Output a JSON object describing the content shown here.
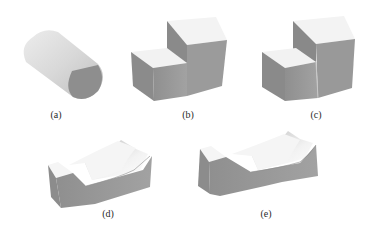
{
  "figure": {
    "panels": [
      {
        "id": "a",
        "label": "(a)",
        "shape": "half-sectioned cylinder"
      },
      {
        "id": "b",
        "label": "(b)",
        "shape": "stepped block"
      },
      {
        "id": "c",
        "label": "(c)",
        "shape": "stepped block with seam"
      },
      {
        "id": "d",
        "label": "(d)",
        "shape": "block with curved saddle cut"
      },
      {
        "id": "e",
        "label": "(e)",
        "shape": "saddle block with tapered sides"
      }
    ],
    "colors": {
      "top_face": "#f4f4f4",
      "front_face": "#9a9a9a",
      "side_face": "#8c8c8c",
      "label": "#2a2a2a"
    }
  }
}
